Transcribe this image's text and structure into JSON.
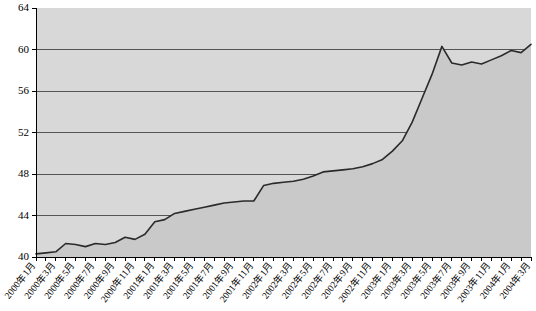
{
  "chart_data": {
    "type": "area",
    "title": "",
    "subtitle": "",
    "xlabel": "",
    "ylabel": "",
    "ylim": [
      40,
      64
    ],
    "y_ticks": [
      40,
      44,
      48,
      52,
      56,
      60,
      64
    ],
    "grid": true,
    "legend": "none",
    "colors": {
      "plot_background": "#d8d8d8",
      "area_fill": "#c9c9c9",
      "line": "#2a2a2a",
      "gridline": "#555555",
      "axis": "#000000",
      "page_background": "#ffffff"
    },
    "x_tick_labels": [
      "2000年1月",
      "2000年3月",
      "2000年5月",
      "2000年7月",
      "2000年9月",
      "2000年11月",
      "2001年1月",
      "2001年3月",
      "2001年5月",
      "2001年7月",
      "2001年9月",
      "2001年11月",
      "2002年1月",
      "2002年3月",
      "2002年5月",
      "2002年7月",
      "2002年9月",
      "2002年11月",
      "2003年1月",
      "2003年3月",
      "2003年5月",
      "2003年7月",
      "2003年9月",
      "2003年11月",
      "2004年1月",
      "2004年3月"
    ],
    "categories": [
      "2000年1月",
      "2000年2月",
      "2000年3月",
      "2000年4月",
      "2000年5月",
      "2000年6月",
      "2000年7月",
      "2000年8月",
      "2000年9月",
      "2000年10月",
      "2000年11月",
      "2000年12月",
      "2001年1月",
      "2001年2月",
      "2001年3月",
      "2001年4月",
      "2001年5月",
      "2001年6月",
      "2001年7月",
      "2001年8月",
      "2001年9月",
      "2001年10月",
      "2001年11月",
      "2001年12月",
      "2002年1月",
      "2002年2月",
      "2002年3月",
      "2002年4月",
      "2002年5月",
      "2002年6月",
      "2002年7月",
      "2002年8月",
      "2002年9月",
      "2002年10月",
      "2002年11月",
      "2002年12月",
      "2003年1月",
      "2003年2月",
      "2003年3月",
      "2003年4月",
      "2003年5月",
      "2003年6月",
      "2003年7月",
      "2003年8月",
      "2003年9月",
      "2003年10月",
      "2003年11月",
      "2003年12月",
      "2004年1月",
      "2004年2月",
      "2004年3月"
    ],
    "values": [
      40.3,
      40.4,
      40.5,
      41.3,
      41.2,
      41.0,
      41.3,
      41.2,
      41.4,
      41.9,
      41.7,
      42.2,
      43.4,
      43.6,
      44.2,
      44.4,
      44.6,
      44.8,
      45.0,
      45.2,
      45.3,
      45.4,
      45.4,
      46.9,
      47.1,
      47.2,
      47.3,
      47.5,
      47.8,
      48.2,
      48.3,
      48.4,
      48.5,
      48.7,
      49.0,
      49.4,
      50.2,
      51.2,
      53.0,
      55.3,
      57.6,
      60.3,
      58.7,
      58.5,
      58.8,
      58.6,
      59.0,
      59.4,
      59.9,
      59.7,
      60.5
    ],
    "series": [
      {
        "name": "",
        "values": [
          40.3,
          40.4,
          40.5,
          41.3,
          41.2,
          41.0,
          41.3,
          41.2,
          41.4,
          41.9,
          41.7,
          42.2,
          43.4,
          43.6,
          44.2,
          44.4,
          44.6,
          44.8,
          45.0,
          45.2,
          45.3,
          45.4,
          45.4,
          46.9,
          47.1,
          47.2,
          47.3,
          47.5,
          47.8,
          48.2,
          48.3,
          48.4,
          48.5,
          48.7,
          49.0,
          49.4,
          50.2,
          51.2,
          53.0,
          55.3,
          57.6,
          60.3,
          58.7,
          58.5,
          58.8,
          58.6,
          59.0,
          59.4,
          59.9,
          59.7,
          60.5
        ]
      }
    ]
  }
}
